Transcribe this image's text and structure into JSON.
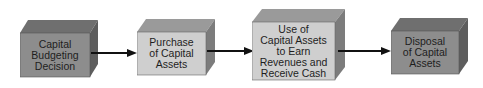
{
  "diagram": {
    "type": "process-flow",
    "colors": {
      "front_dark": "#8d8d8d",
      "top_dark": "#6f6f6f",
      "side_dark": "#5e5e5e",
      "front_light": "#cfcfcf",
      "top_light": "#9a9a9a",
      "side_light": "#7c7c7c",
      "arrow": "#111111",
      "text": "#1e1e1e"
    },
    "steps": [
      {
        "label": "Capital\nBudgeting\nDecision",
        "shade": "dark"
      },
      {
        "label": "Purchase\nof Capital\nAssets",
        "shade": "light"
      },
      {
        "label": "Use of\nCapital Assets\nto Earn\nRevenues and\nReceive Cash",
        "shade": "light"
      },
      {
        "label": "Disposal\nof Capital\nAssets",
        "shade": "dark"
      }
    ],
    "connectors": [
      {
        "from": 0,
        "to": 1
      },
      {
        "from": 1,
        "to": 2
      },
      {
        "from": 2,
        "to": 3
      }
    ]
  }
}
